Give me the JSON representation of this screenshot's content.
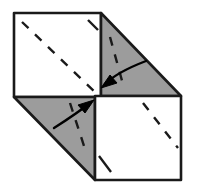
{
  "figure": {
    "canvas": {
      "width": 197,
      "height": 196,
      "background": "#ffffff"
    }
  },
  "style": {
    "paper_white": "#ffffff",
    "paper_shaded": "#9c9c9c",
    "outline_color": "#1a1a1a",
    "outline_width": 2.6,
    "dash_color": "#1a1a1a",
    "dash_width": 2.4,
    "dash_pattern": "9 9",
    "arrow_color": "#000000",
    "arrow_width": 2.4
  },
  "shapes": [
    {
      "name": "top-left-square-panel",
      "kind": "square",
      "fill": "white",
      "points": "14,13 101,13 101,97 14,97"
    },
    {
      "name": "top-right-triangle-flap",
      "kind": "triangle",
      "fill": "shaded",
      "points": "101,13 181,96 101,96"
    },
    {
      "name": "bottom-left-triangle-flap",
      "kind": "triangle",
      "fill": "shaded",
      "points": "14,97 95,97 95,180"
    },
    {
      "name": "bottom-right-square-panel",
      "kind": "square",
      "fill": "white",
      "points": "95,96 181,96 181,180 95,180"
    }
  ],
  "fold_lines": [
    {
      "name": "fold-line-top-left-main-diagonal",
      "x1": 22,
      "y1": 22,
      "x2": 95,
      "y2": 92
    },
    {
      "name": "fold-line-top-left-corner-tick",
      "x1": 88,
      "y1": 20,
      "x2": 98,
      "y2": 30
    },
    {
      "name": "fold-line-top-right-triangle",
      "x1": 110,
      "y1": 37,
      "x2": 124,
      "y2": 88
    },
    {
      "name": "fold-line-bottom-left-triangle",
      "x1": 70,
      "y1": 103,
      "x2": 86,
      "y2": 152
    },
    {
      "name": "fold-line-bottom-right-main-diagonal",
      "x1": 143,
      "y1": 103,
      "x2": 178,
      "y2": 148
    },
    {
      "name": "fold-line-bottom-right-corner-tick",
      "x1": 99,
      "y1": 156,
      "x2": 111,
      "y2": 172
    }
  ],
  "arrows": [
    {
      "name": "fold-arrow-top-down-left",
      "direction": "down-left",
      "path": "M 146 61 C 133 66 115 74 105 84",
      "head": "104,85 116,84 110,76"
    },
    {
      "name": "fold-arrow-bottom-up-right",
      "direction": "up-right",
      "path": "M 54 128 C 65 121 80 111 90 103",
      "head": "91,102 79,103 85,111"
    }
  ]
}
